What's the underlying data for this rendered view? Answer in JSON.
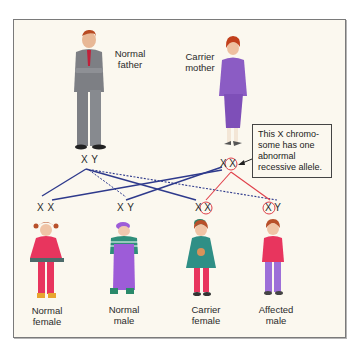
{
  "parents": {
    "father": {
      "label_line1": "Normal",
      "label_line2": "father",
      "chromosomes": "X Y",
      "colors": {
        "suit": "#7d7f84",
        "tie": "#c0203a",
        "hair": "#b84a22"
      }
    },
    "mother": {
      "label_line1": "Carrier",
      "label_line2": "mother",
      "chromosomes_normal": "X",
      "chromosomes_abnormal": "X",
      "colors": {
        "suit": "#8b5cc4",
        "hair": "#c2401c"
      }
    }
  },
  "callout": {
    "text": "This X chromo-some has one abnormal recessive allele."
  },
  "children": [
    {
      "label_line1": "Normal",
      "label_line2": "female",
      "chromosomes": "X X",
      "colors": {
        "top": "#e8355e",
        "shoes": "#e8a530"
      }
    },
    {
      "label_line1": "Normal",
      "label_line2": "male",
      "chromosomes": "X Y",
      "colors": {
        "top": "#2f8f7a",
        "overalls": "#9d5cd8",
        "hat": "#9d5cd8"
      }
    },
    {
      "label_line1": "Carrier",
      "label_line2": "female",
      "chromosomes_normal": "X",
      "chromosomes_abnormal": "X",
      "colors": {
        "dress": "#2f8f86",
        "legs": "#e8355e"
      }
    },
    {
      "label_line1": "Affected",
      "label_line2": "male",
      "chromosomes_abnormal": "X",
      "chromosomes_normal": "Y",
      "colors": {
        "top": "#e8355e",
        "pants": "#9d6fd8"
      }
    }
  ],
  "colors": {
    "inheritance_line_normal": "#2e3a8c",
    "inheritance_line_abnormal": "#e0404a",
    "background": "#fbf8ef",
    "frame": "#7a7a7a"
  }
}
